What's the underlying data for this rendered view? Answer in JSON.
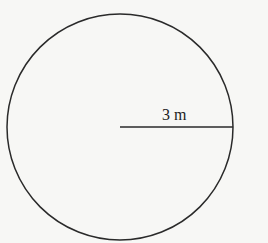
{
  "diagram": {
    "shape": "circle",
    "radius_label": "3 m",
    "stroke_color": "#2a2a2a",
    "background": "#f7f7f5"
  }
}
